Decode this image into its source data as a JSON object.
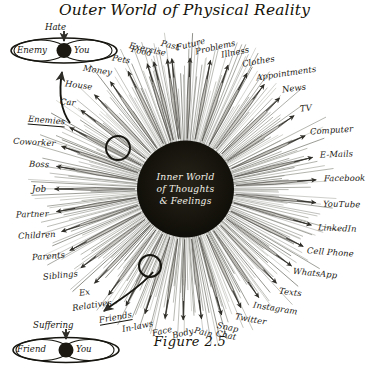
{
  "figure": {
    "title": "Outer World of Physical Reality",
    "caption": "Figure 2.5",
    "center_lines": [
      "Inner World",
      "of Thoughts",
      "& Feelings"
    ],
    "colors": {
      "ink": "#16150f",
      "core_fill": "#121108",
      "core_text": "#f2efe6",
      "ray_light": "#9a978e",
      "ray_dark": "#3c3a33",
      "background": "#ffffff"
    }
  },
  "pods": {
    "top": {
      "trigger": "Hate",
      "left_label": "Enemy",
      "right_label": "You",
      "source_label": "Enemies"
    },
    "bottom": {
      "trigger": "Suffering",
      "left_label": "Friend",
      "right_label": "You",
      "source_label": "Friends"
    }
  },
  "rays": [
    {
      "label": "Exercise",
      "angle": -104,
      "dir": "out"
    },
    {
      "label": "Past",
      "angle": -96,
      "dir": "out"
    },
    {
      "label": "Future",
      "angle": -88,
      "dir": "out"
    },
    {
      "label": "Problems",
      "angle": -79,
      "dir": "out"
    },
    {
      "label": "Illness",
      "angle": -71,
      "dir": "out"
    },
    {
      "label": "Clothes",
      "angle": -62,
      "dir": "out"
    },
    {
      "label": "Appointments",
      "angle": -53,
      "dir": "out"
    },
    {
      "label": "News",
      "angle": -44,
      "dir": "out"
    },
    {
      "label": "TV",
      "angle": -34,
      "dir": "out"
    },
    {
      "label": "Computer",
      "angle": -24,
      "dir": "out"
    },
    {
      "label": "E-Mails",
      "angle": -14,
      "dir": "out"
    },
    {
      "label": "Facebook",
      "angle": -4,
      "dir": "out"
    },
    {
      "label": "YouTube",
      "angle": 6,
      "dir": "out"
    },
    {
      "label": "LinkedIn",
      "angle": 16,
      "dir": "out"
    },
    {
      "label": "Cell Phone",
      "angle": 26,
      "dir": "out"
    },
    {
      "label": "WhatsApp",
      "angle": 36,
      "dir": "out"
    },
    {
      "label": "Texts",
      "angle": 46,
      "dir": "out"
    },
    {
      "label": "Instagram",
      "angle": 56,
      "dir": "out"
    },
    {
      "label": "Twitter",
      "angle": 65,
      "dir": "out"
    },
    {
      "label": "Snap Chat",
      "angle": 74,
      "dir": "out"
    },
    {
      "label": "Pain",
      "angle": 83,
      "dir": "out"
    },
    {
      "label": "Body",
      "angle": 91,
      "dir": "out"
    },
    {
      "label": "Face",
      "angle": 99,
      "dir": "out"
    },
    {
      "label": "In-laws",
      "angle": 108,
      "dir": "in"
    },
    {
      "label": "Friends",
      "angle": 117,
      "dir": "in"
    },
    {
      "label": "Relatives",
      "angle": 126,
      "dir": "in"
    },
    {
      "label": "Ex",
      "angle": 134,
      "dir": "in"
    },
    {
      "label": "Siblings",
      "angle": 143,
      "dir": "in"
    },
    {
      "label": "Parents",
      "angle": 152,
      "dir": "in"
    },
    {
      "label": "Children",
      "angle": 161,
      "dir": "in"
    },
    {
      "label": "Partner",
      "angle": 170,
      "dir": "in"
    },
    {
      "label": "Job",
      "angle": 180,
      "dir": "in"
    },
    {
      "label": "Boss",
      "angle": 190,
      "dir": "in"
    },
    {
      "label": "Coworker",
      "angle": 199,
      "dir": "in"
    },
    {
      "label": "Enemies",
      "angle": 208,
      "dir": "in"
    },
    {
      "label": "Car",
      "angle": 217,
      "dir": "in"
    },
    {
      "label": "House",
      "angle": 226,
      "dir": "in"
    },
    {
      "label": "Money",
      "angle": 235,
      "dir": "in"
    },
    {
      "label": "Pets",
      "angle": 244,
      "dir": "in"
    },
    {
      "label": "Food",
      "angle": 253,
      "dir": "in"
    },
    {
      "label": "Exercise2",
      "angle": 262,
      "dir": "in"
    }
  ],
  "highlight_circles": [
    {
      "name": "upper-left-ray-highlight",
      "cx": 118,
      "cy": 148,
      "r": 12
    },
    {
      "name": "lower-ray-highlight",
      "cx": 150,
      "cy": 266,
      "r": 11
    }
  ]
}
